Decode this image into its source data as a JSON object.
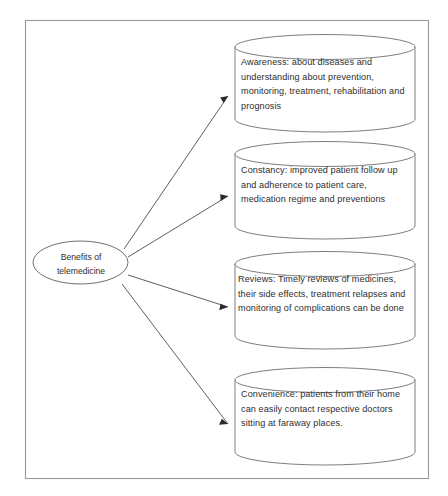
{
  "diagram": {
    "source_node": {
      "label": "Benefits of\ntelemedicine",
      "shape": "ellipse"
    },
    "nodes": [
      {
        "id": "awareness",
        "shape": "cylinder",
        "label": "Awareness: about diseases and understanding about prevention, monitoring, treatment, rehabilitation and prognosis"
      },
      {
        "id": "constancy",
        "shape": "cylinder",
        "label": "Constancy: improved patient follow up and adherence to patient care, medication regime and preventions"
      },
      {
        "id": "reviews",
        "shape": "cylinder",
        "label": "Reviews: Timely reviews of medicines, their side effects, treatment relapses and monitoring of complications can be done"
      },
      {
        "id": "convenience",
        "shape": "cylinder",
        "label": "Convenience: patients from their home can easily contact respective doctors sitting at faraway places."
      }
    ],
    "edges": [
      {
        "from": "source_node",
        "to": "awareness",
        "style": "arrow"
      },
      {
        "from": "source_node",
        "to": "constancy",
        "style": "arrow"
      },
      {
        "from": "source_node",
        "to": "reviews",
        "style": "arrow"
      },
      {
        "from": "source_node",
        "to": "convenience",
        "style": "arrow"
      }
    ],
    "colors": {
      "frame_stroke": "#9a9a9a",
      "shape_stroke": "#6f6f6f",
      "connector_stroke": "#4c4c4c",
      "text": "#2e2e2e",
      "background": "#ffffff"
    }
  }
}
